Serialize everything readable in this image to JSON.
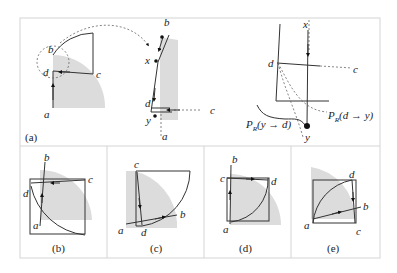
{
  "figure": {
    "panels": [
      {
        "id": "a",
        "caption": "(a)",
        "labels": {
          "left_b": "b",
          "left_d": "d",
          "left_c": "c",
          "left_a": "a",
          "mid_b": "b",
          "mid_x": "x",
          "mid_d": "d",
          "mid_y": "y",
          "mid_c": "c",
          "mid_a": "a",
          "right_x": "x",
          "right_d": "d",
          "right_c": "c",
          "right_y": "y",
          "pr_yd": "P",
          "pr_yd_sub": "R",
          "pr_yd_arg": "(y → d)",
          "pr_dy": "P",
          "pr_dy_sub": "R",
          "pr_dy_arg": "(d → y)"
        }
      },
      {
        "id": "b",
        "caption": "(b)",
        "labels": {
          "a": "a",
          "b": "b",
          "c": "c",
          "d": "d"
        }
      },
      {
        "id": "c",
        "caption": "(c)",
        "labels": {
          "a": "a",
          "b": "b",
          "c": "c",
          "d": "d"
        }
      },
      {
        "id": "d",
        "caption": "(d)",
        "labels": {
          "a": "a",
          "b": "b",
          "c": "c",
          "d": "d"
        }
      },
      {
        "id": "e",
        "caption": "(e)",
        "labels": {
          "a": "a",
          "b": "b",
          "c": "c",
          "d": "d"
        }
      }
    ],
    "colors": {
      "shade": "#dcdcdc",
      "stroke": "#333333",
      "frame": "#d4d4d4"
    }
  }
}
